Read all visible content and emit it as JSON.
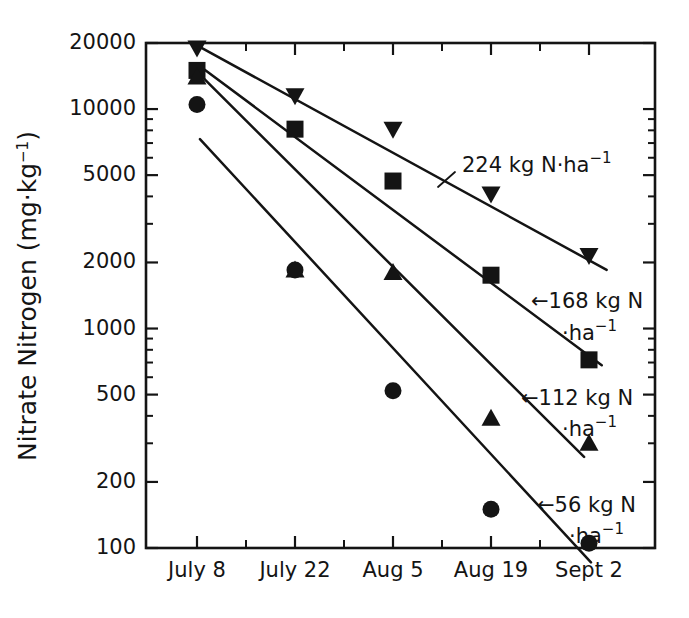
{
  "chart_data": {
    "type": "scatter",
    "title": "",
    "xlabel": "",
    "ylabel": "Nitrate Nitrogen (mg·kg−1)",
    "ylabel_parts": {
      "main": "Nitrate Nitrogen (mg·kg",
      "exponent": "−1",
      "close": ")"
    },
    "scale": "log",
    "ylim": [
      100,
      20000
    ],
    "ytick_labels": [
      "20000",
      "10000",
      "5000",
      "2000",
      "1000",
      "500",
      "200",
      "100"
    ],
    "ytick_values": [
      20000,
      10000,
      5000,
      2000,
      1000,
      500,
      200,
      100
    ],
    "categories": [
      "July 8",
      "July 22",
      "Aug 5",
      "Aug 19",
      "Sept 2"
    ],
    "x_index": [
      0,
      1,
      2,
      3,
      4
    ],
    "grid": false,
    "legend_position": "inline-annotations",
    "series": [
      {
        "name": "224 kg N·ha−1",
        "rate_kg_n_ha": 224,
        "marker": "triangle-down",
        "values": [
          19000,
          11500,
          8100,
          4100,
          2150
        ],
        "fit_line": {
          "x_start": 0.0,
          "y_start": 19500,
          "x_end": 4.18,
          "y_end": 1850
        }
      },
      {
        "name": "168 kg N·ha−1",
        "rate_kg_n_ha": 168,
        "marker": "square",
        "values": [
          15000,
          8100,
          4700,
          1750,
          720
        ],
        "fit_line": {
          "x_start": 0.02,
          "y_start": 15800,
          "x_end": 4.13,
          "y_end": 680
        }
      },
      {
        "name": "112 kg N·ha−1",
        "rate_kg_n_ha": 112,
        "marker": "triangle-up",
        "values": [
          14000,
          1850,
          1800,
          390,
          300
        ],
        "fit_line": {
          "x_start": 0.02,
          "y_start": 14500,
          "x_end": 3.95,
          "y_end": 260
        }
      },
      {
        "name": "56 kg N·ha−1",
        "rate_kg_n_ha": 56,
        "marker": "circle",
        "values": [
          10500,
          1850,
          520,
          150,
          105
        ],
        "fit_line": {
          "x_start": 0.03,
          "y_start": 7300,
          "x_end": 4.02,
          "y_end": 86
        }
      }
    ],
    "annotations": [
      {
        "id": "ann-224",
        "prefix": "",
        "line1": "224 kg N·ha",
        "exponent": "−1",
        "line2": "",
        "text_x": 462,
        "text_y": 166,
        "leader": {
          "x1": 455,
          "y1": 172,
          "x2": 438,
          "y2": 187
        }
      },
      {
        "id": "ann-168",
        "prefix": "←",
        "line1": "168 kg N",
        "line2": "·ha",
        "exponent": "−1",
        "text_x": 531,
        "text_y": 302,
        "text2_x": 562,
        "text2_y": 334
      },
      {
        "id": "ann-112",
        "prefix": "←",
        "line1": "112 kg N",
        "line2": "·ha",
        "exponent": "−1",
        "text_x": 521,
        "text_y": 399,
        "text2_x": 562,
        "text2_y": 430
      },
      {
        "id": "ann-56",
        "prefix": "←",
        "line1": "56 kg N",
        "line2": "·ha",
        "exponent": "−1",
        "text_x": 537,
        "text_y": 506,
        "text2_x": 569,
        "text2_y": 537
      }
    ]
  }
}
